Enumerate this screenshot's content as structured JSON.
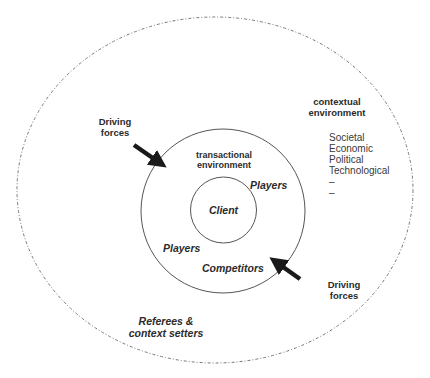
{
  "diagram": {
    "outer_ring": {
      "title_line1": "contextual",
      "title_line2": "environment",
      "factors": [
        "Societal",
        "Economic",
        "Political",
        "Technological",
        "–",
        "–"
      ],
      "referees_line1": "Referees &",
      "referees_line2": "context setters"
    },
    "middle_ring": {
      "title_line1": "transactional",
      "title_line2": "environment",
      "players_upper": "Players",
      "players_lower": "Players",
      "competitors": "Competitors"
    },
    "inner_ring": {
      "label": "Client"
    },
    "driving_forces": [
      {
        "line1": "Driving",
        "line2": "forces"
      },
      {
        "line1": "Driving",
        "line2": "forces"
      }
    ],
    "colors": {
      "stroke": "#555555",
      "dashed_stroke": "#777777",
      "arrow": "#1a1a1a",
      "text": "#2b2b2b"
    }
  }
}
